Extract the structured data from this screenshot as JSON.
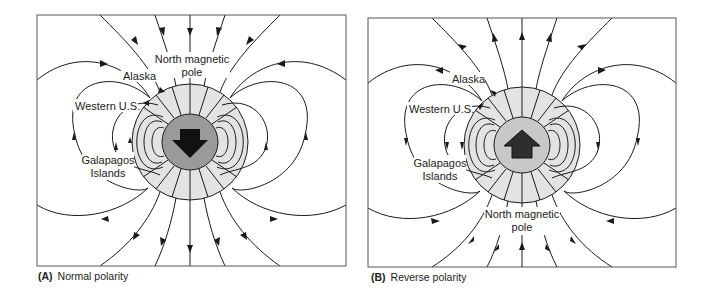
{
  "figure": {
    "panels": [
      {
        "id": "A",
        "caption_letter": "(A)",
        "caption_text": "Normal polarity",
        "arrow_direction": "down",
        "field_direction": "inward-at-north",
        "labels": {
          "north_pole_line1": "North magnetic",
          "north_pole_line2": "pole",
          "alaska": "Alaska",
          "western_us": "Western U.S.",
          "galapagos_line1": "Galapagos",
          "galapagos_line2": "Islands"
        }
      },
      {
        "id": "B",
        "caption_letter": "(B)",
        "caption_text": "Reverse polarity",
        "arrow_direction": "up",
        "field_direction": "outward-at-north",
        "labels": {
          "north_pole_line1": "North magnetic",
          "north_pole_line2": "pole",
          "alaska": "Alaska",
          "western_us": "Western U.S.",
          "galapagos_line1": "Galapagos",
          "galapagos_line2": "Islands"
        }
      }
    ],
    "colors": {
      "earth_shell": "#e3e3e3",
      "core_A": "#9a9a9a",
      "core_B": "#c8c8c8",
      "arrow_A": "#111111",
      "arrow_B": "#2e2e2e",
      "line": "#1a1a1a",
      "frame": "#555555"
    }
  }
}
